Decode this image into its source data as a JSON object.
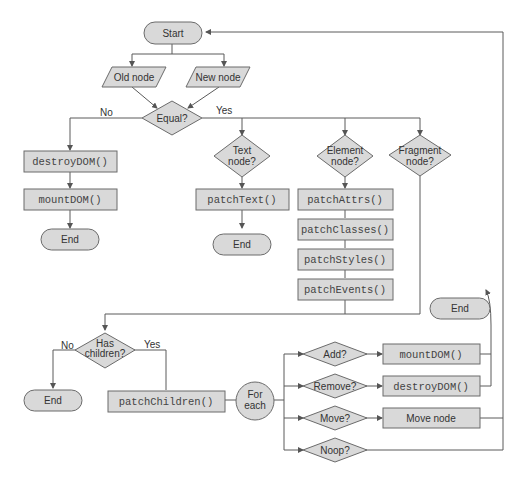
{
  "diagram": {
    "start": "Start",
    "old_node": "Old node",
    "new_node": "New node",
    "equal": "Equal?",
    "no": "No",
    "yes": "Yes",
    "destroy_dom_1": "destroyDOM()",
    "mount_dom_1": "mountDOM()",
    "end_1": "End",
    "text_node_l1": "Text",
    "text_node_l2": "node?",
    "patch_text": "patchText()",
    "end_2": "End",
    "element_node_l1": "Element",
    "element_node_l2": "node?",
    "fragment_node_l1": "Fragment",
    "fragment_node_l2": "node?",
    "patch_attrs": "patchAttrs()",
    "patch_classes": "patchClasses()",
    "patch_styles": "patchStyles()",
    "patch_events": "patchEvents()",
    "has_children_l1": "Has",
    "has_children_l2": "children?",
    "no_2": "No",
    "yes_2": "Yes",
    "end_3": "End",
    "patch_children": "patchChildren()",
    "for_each_l1": "For",
    "for_each_l2": "each",
    "add": "Add?",
    "remove": "Remove?",
    "move": "Move?",
    "noop": "Noop?",
    "mount_dom_2": "mountDOM()",
    "destroy_dom_2": "destroyDOM()",
    "move_node": "Move node",
    "end_4": "End"
  },
  "colors": {
    "shape_fill": "#d9d9d9",
    "stroke": "#6b6b6b",
    "background": "#ffffff"
  }
}
